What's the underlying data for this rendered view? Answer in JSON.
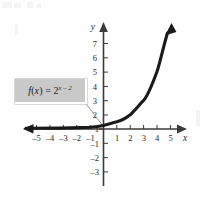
{
  "chart_data": {
    "type": "line",
    "title": "",
    "subtitle": "",
    "xlabel": "x",
    "ylabel": "y",
    "xlim": [
      -5.8,
      6.0
    ],
    "ylim": [
      -3.6,
      7.8
    ],
    "grid": false,
    "legend_position": "none",
    "x_ticks": [
      -5,
      -4,
      -3,
      -2,
      -1,
      1,
      2,
      3,
      4,
      5
    ],
    "x_tick_labels": [
      "–5",
      "–4",
      "–3",
      "–2",
      "–1",
      "1",
      "2",
      "3",
      "4",
      "5"
    ],
    "y_ticks": [
      7,
      6,
      5,
      4,
      3,
      2,
      1,
      -1,
      -2,
      -3
    ],
    "y_tick_labels": [
      "7",
      "6",
      "5",
      "4",
      "3",
      "2",
      "1",
      "–1",
      "–2",
      "–3"
    ],
    "series": [
      {
        "name": "f(x) = 2^(x-2)",
        "expression": "2^(x-2)",
        "x": [
          -5.8,
          -5,
          -4,
          -3,
          -2,
          -1,
          0,
          1,
          2,
          3,
          4,
          4.5,
          5,
          5.1
        ],
        "values": [
          0.011,
          0.016,
          0.031,
          0.063,
          0.125,
          0.25,
          0.25,
          0.5,
          1.0,
          2.0,
          4.0,
          5.66,
          8.0,
          8.57
        ],
        "color": "#1a1a1a",
        "arrow_end": true
      }
    ],
    "annotations": [
      {
        "name": "function-label",
        "text": "f(x) = 2^(x-2)",
        "text_display": "f(x) = 2",
        "exponent_display": "x – 2",
        "box_fill": "#c9c9c9",
        "leader_line": true
      }
    ],
    "axis_color": "#3a3a3a",
    "curve_color": "#1a1a1a"
  },
  "axes": {
    "x_axis_name": "x",
    "y_axis_name": "y"
  }
}
